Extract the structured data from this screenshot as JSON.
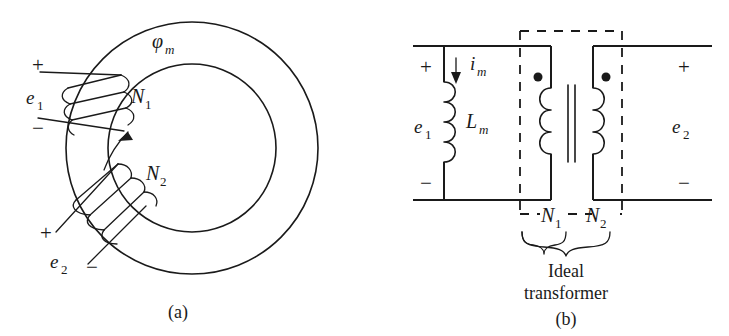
{
  "figure": {
    "background_color": "#ffffff",
    "ink_color": "#1a1a1a",
    "panels": [
      {
        "id": "a",
        "caption": "(a)",
        "title": "toroidal core transformer",
        "labels": {
          "flux": "φ",
          "flux_sub": "m",
          "primary_emf": "e",
          "primary_emf_sub": "1",
          "secondary_emf": "e",
          "secondary_emf_sub": "2",
          "primary_turns": "N",
          "primary_turns_sub": "1",
          "secondary_turns": "N",
          "secondary_turns_sub": "2",
          "plus_primary": "+",
          "minus_primary": "−",
          "plus_secondary": "+",
          "minus_secondary": "−"
        }
      },
      {
        "id": "b",
        "caption": "(b)",
        "title": "equivalent circuit model",
        "labels": {
          "magnetizing_current": "i",
          "magnetizing_current_sub": "m",
          "magnetizing_inductance": "L",
          "magnetizing_inductance_sub": "m",
          "primary_emf": "e",
          "primary_emf_sub": "1",
          "secondary_emf": "e",
          "secondary_emf_sub": "2",
          "primary_turns": "N",
          "primary_turns_sub": "1",
          "secondary_turns": "N",
          "secondary_turns_sub": "2",
          "plus_left": "+",
          "minus_left": "−",
          "plus_right": "+",
          "minus_right": "−",
          "bracket_label_line1": "Ideal",
          "bracket_label_line2": "transformer"
        }
      }
    ]
  }
}
